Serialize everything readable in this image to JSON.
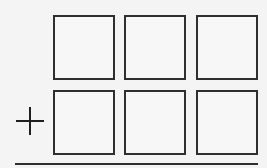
{
  "puzzle": {
    "type": "column-addition",
    "operator": "+",
    "operator_name": "plus",
    "rows": [
      {
        "digits": [
          "",
          "",
          ""
        ]
      },
      {
        "digits": [
          "",
          "",
          ""
        ]
      }
    ],
    "colors": {
      "background": "#f4f4f4",
      "stroke": "#2f2f2f"
    }
  }
}
